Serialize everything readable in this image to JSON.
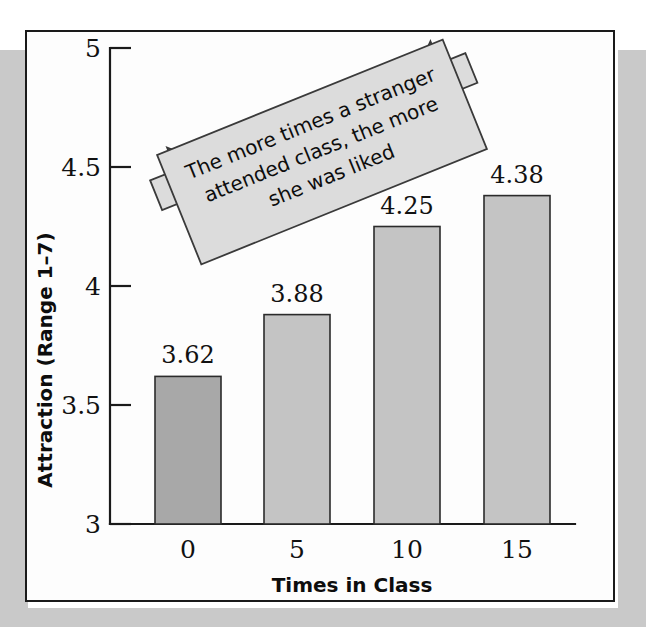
{
  "figure": {
    "background_color": "#ffffff",
    "band_color": "#c9c9c9",
    "frame_color": "#1a1a1a"
  },
  "callout": {
    "line1": "The more times a stranger",
    "line2": "attended class, the more",
    "line3": "she was liked",
    "fill_color": "#dcdcdc",
    "border_color": "#3a3a3a",
    "rotation_degrees": -22,
    "shape": "double-headed-arrow-banner"
  },
  "chart_data": {
    "type": "bar",
    "title": "",
    "xlabel": "Times in Class",
    "ylabel": "Attraction (Range 1–7)",
    "categories": [
      "0",
      "5",
      "10",
      "15"
    ],
    "values": [
      3.62,
      3.88,
      4.25,
      4.38
    ],
    "value_labels": [
      "3.62",
      "3.88",
      "4.25",
      "4.38"
    ],
    "ylim": [
      3,
      5
    ],
    "yticks": [
      3,
      3.5,
      4,
      4.5,
      5
    ],
    "ytick_labels": [
      "3",
      "3.5",
      "4",
      "4.5",
      "5"
    ],
    "grid": false,
    "legend": false,
    "bar_colors": [
      "#a8a8a8",
      "#c4c4c4",
      "#c4c4c4",
      "#c4c4c4"
    ],
    "bar_edge_color": "#2b2b2b"
  }
}
